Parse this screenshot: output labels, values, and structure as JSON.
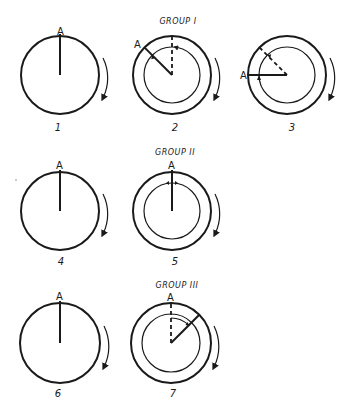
{
  "diagram": {
    "stroke_color": "#1a1a1a",
    "background": "#ffffff",
    "groups": [
      {
        "title": "GROUP I",
        "title_pos": [
          178,
          24
        ]
      },
      {
        "title": "GROUP II",
        "title_pos": [
          175,
          155
        ]
      },
      {
        "title": "GROUP III",
        "title_pos": [
          177,
          288
        ]
      }
    ],
    "figures": [
      {
        "number": "1",
        "label_A": "A",
        "center": [
          60,
          75
        ],
        "outer_r": 39,
        "inner_r": null,
        "solid_angle_deg": -90,
        "dashed_angle_deg": null,
        "group": null
      },
      {
        "number": "2",
        "label_A": "A",
        "center": [
          172,
          75
        ],
        "outer_r": 39,
        "inner_r": 28,
        "solid_angle_deg": -135,
        "dashed_angle_deg": -90,
        "group": "GROUP I"
      },
      {
        "number": "3",
        "label_A": "A",
        "center": [
          287,
          75
        ],
        "outer_r": 39,
        "inner_r": 28,
        "solid_angle_deg": 180,
        "dashed_angle_deg": -135,
        "group": "GROUP I"
      },
      {
        "number": "4",
        "label_A": "A",
        "center": [
          60,
          211
        ],
        "outer_r": 39,
        "inner_r": null,
        "solid_angle_deg": -90,
        "dashed_angle_deg": null,
        "group": null
      },
      {
        "number": "5",
        "label_A": "A",
        "center": [
          172,
          211
        ],
        "outer_r": 39,
        "inner_r": 28,
        "solid_angle_deg": -90,
        "dashed_angle_deg": null,
        "group": "GROUP II"
      },
      {
        "number": "6",
        "label_A": "A",
        "center": [
          60,
          343
        ],
        "outer_r": 40,
        "inner_r": null,
        "solid_angle_deg": -90,
        "dashed_angle_deg": null,
        "group": null
      },
      {
        "number": "7",
        "label_A": "A",
        "center": [
          171,
          343
        ],
        "outer_r": 40,
        "inner_r": 29,
        "solid_angle_deg": -45,
        "dashed_angle_deg": -90,
        "group": "GROUP III"
      }
    ],
    "rotation_arrows": "clockwise"
  }
}
